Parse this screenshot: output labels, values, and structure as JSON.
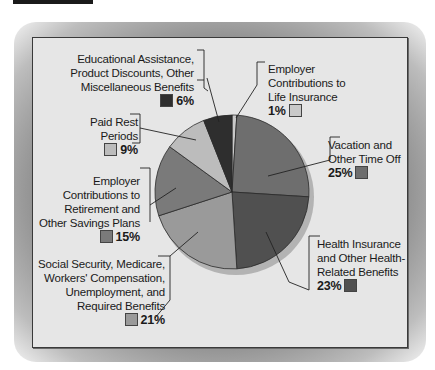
{
  "chart_data": {
    "type": "pie",
    "title": "",
    "start_angle": "12 o'clock",
    "direction": "clockwise",
    "slices": [
      {
        "label": "Employer Contributions to Life Insurance",
        "value": 1,
        "pct_label": "1%",
        "color": "#c9c9c9"
      },
      {
        "label": "Vacation and Other Time Off",
        "value": 25,
        "pct_label": "25%",
        "color": "#6e6e6e"
      },
      {
        "label": "Health Insurance and Other Health-Related Benefits",
        "value": 23,
        "pct_label": "23%",
        "color": "#505050"
      },
      {
        "label": "Social Security, Medicare, Workers' Compensation, Unemployment, and Required Benefits",
        "value": 21,
        "pct_label": "21%",
        "color": "#9a9a9a"
      },
      {
        "label": "Employer Contributions to Retirement and Other Savings Plans",
        "value": 15,
        "pct_label": "15%",
        "color": "#7a7a7a"
      },
      {
        "label": "Paid Rest Periods",
        "value": 9,
        "pct_label": "9%",
        "color": "#bcbcbc"
      },
      {
        "label": "Educational Assistance, Product Discounts, Other Miscellaneous Benefits",
        "value": 6,
        "pct_label": "6%",
        "color": "#2e2e2e"
      }
    ]
  },
  "labels": {
    "life": {
      "lines": [
        "Employer",
        "Contributions to",
        "Life Insurance"
      ],
      "pct": "1%"
    },
    "vacation": {
      "lines": [
        "Vacation and",
        "Other Time Off"
      ],
      "pct": "25%"
    },
    "health": {
      "lines": [
        "Health Insurance",
        "and Other Health-",
        "Related Benefits"
      ],
      "pct": "23%"
    },
    "social": {
      "lines": [
        "Social Security, Medicare,",
        "Workers' Compensation,",
        "Unemployment, and",
        "Required Benefits"
      ],
      "pct": "21%"
    },
    "retirement": {
      "lines": [
        "Employer",
        "Contributions to",
        "Retirement and",
        "Other Savings Plans"
      ],
      "pct": "15%"
    },
    "rest": {
      "lines": [
        "Paid Rest",
        "Periods"
      ],
      "pct": "9%"
    },
    "education": {
      "lines": [
        "Educational Assistance,",
        "Product Discounts, Other",
        "Miscellaneous Benefits"
      ],
      "pct": "6%"
    }
  }
}
